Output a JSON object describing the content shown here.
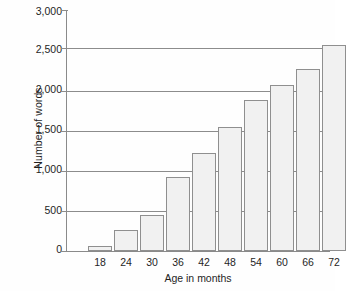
{
  "chart_data": {
    "type": "bar",
    "title": "",
    "xlabel": "Age in months",
    "ylabel": "Number of words",
    "categories": [
      "18",
      "24",
      "30",
      "36",
      "42",
      "48",
      "54",
      "60",
      "66",
      "72"
    ],
    "values": [
      60,
      265,
      450,
      920,
      1220,
      1540,
      1870,
      2060,
      2260,
      2550
    ],
    "ylim": [
      0,
      3000
    ],
    "ytick_labels": [
      "3,000",
      "2,500",
      "2,000",
      "1,500",
      "1,000",
      "500",
      "0"
    ],
    "ytick_values": [
      3000,
      2500,
      2000,
      1500,
      1000,
      500,
      0
    ],
    "grid": true,
    "legend": "none",
    "colors": {
      "bar_fill": "#f1f1f1",
      "bar_stroke": "#8f8f8f",
      "axis": "#8a8a8a",
      "grid": "#8c8c8c",
      "text": "#1f1f1f",
      "background": "#fefefe"
    }
  }
}
